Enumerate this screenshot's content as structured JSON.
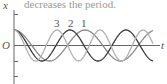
{
  "caption": "decreases the period.",
  "chart_data": {
    "type": "line",
    "title": "",
    "xlabel": "t",
    "ylabel": "x",
    "origin_label": "O",
    "grid": false,
    "legend": "inline labels above first peaks",
    "series": [
      {
        "name": "1",
        "shape": "cosine",
        "amplitude": 1,
        "period_px": 71,
        "color": "#8a8a8a",
        "label_x": 84
      },
      {
        "name": "2",
        "shape": "cosine",
        "amplitude": 1,
        "period_px": 56,
        "color": "#3a3a3a",
        "label_x": 71
      },
      {
        "name": "3",
        "shape": "cosine",
        "amplitude": 1,
        "period_px": 43,
        "color": "#b0b0b0",
        "label_x": 57
      }
    ]
  },
  "axes": {
    "x_label": "t",
    "y_label": "x",
    "origin": "O"
  }
}
